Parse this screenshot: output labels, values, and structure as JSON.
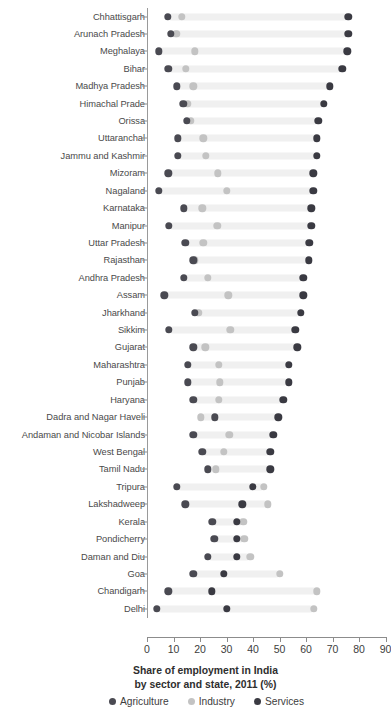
{
  "chart_data": {
    "type": "scatter",
    "title": "Share of employment in India by sector and state, 2011 (%)",
    "title_line1": "Share of employment in India",
    "title_line2": "by sector and state, 2011 (%)",
    "xlabel": "",
    "ylabel": "",
    "xlim": [
      0,
      90
    ],
    "xticks": [
      0,
      10,
      20,
      30,
      40,
      50,
      60,
      70,
      80,
      90
    ],
    "xtick_labels": [
      "0",
      "10",
      "20",
      "30",
      "40",
      "50",
      "60",
      "70",
      "80",
      "90"
    ],
    "grid": false,
    "legend_position": "bottom",
    "legend": [
      {
        "label": "Agriculture",
        "color": "#4a4a52",
        "key": "agriculture"
      },
      {
        "label": "Industry",
        "color": "#c3c3c3",
        "key": "industry"
      },
      {
        "label": "Services",
        "color": "#3a3a42",
        "key": "services"
      }
    ],
    "categories": [
      "Chhattisgarh",
      "Arunach Pradesh",
      "Meghalaya",
      "Bihar",
      "Madhya Pradesh",
      "Himachal Prade",
      "Orissa",
      "Uttaranchal",
      "Jammu and Kashmir",
      "Mizoram",
      "Nagaland",
      "Karnataka",
      "Manipur",
      "Uttar Pradesh",
      "Rajasthan",
      "Andhra Pradesh",
      "Assam",
      "Jharkhand",
      "Sikkim",
      "Gujarat",
      "Maharashtra",
      "Punjab",
      "Haryana",
      "Dadra and Nagar Haveli",
      "Andaman and Nicobar Islands",
      "West Bengal",
      "Tamil Nadu",
      "Tripura",
      "Lakshadweep",
      "Kerala",
      "Pondicherry",
      "Daman and Diu",
      "Goa",
      "Chandigarh",
      "Delhi"
    ],
    "series": [
      {
        "name": "Agriculture",
        "key": "agriculture",
        "color": "#4a4a52",
        "values": [
          7.9,
          9.0,
          4.5,
          8.0,
          11.3,
          13.7,
          15.0,
          11.7,
          11.7,
          8.0,
          4.5,
          14.0,
          8.3,
          14.4,
          17.5,
          14.0,
          6.5,
          18.0,
          8.3,
          17.5,
          15.4,
          15.4,
          17.5,
          25.7,
          17.5,
          20.8,
          23.0,
          11.3,
          14.4,
          24.6,
          25.4,
          23.0,
          17.5,
          8.0,
          3.6
        ]
      },
      {
        "name": "Industry",
        "key": "industry",
        "color": "#c3c3c3",
        "values": [
          13.2,
          11.0,
          18.0,
          14.6,
          17.5,
          15.4,
          16.6,
          21.2,
          22.3,
          26.8,
          30.0,
          20.8,
          26.5,
          21.2,
          18.0,
          23.0,
          30.7,
          19.3,
          31.4,
          22.0,
          27.0,
          27.5,
          27.0,
          20.4,
          31.0,
          29.0,
          26.0,
          44.0,
          45.7,
          36.3,
          36.7,
          39.0,
          50.0,
          64.0,
          63.0
        ]
      },
      {
        "name": "Services",
        "key": "services",
        "color": "#3a3a42",
        "values": [
          76.0,
          76.0,
          75.6,
          73.7,
          69.0,
          66.7,
          64.7,
          64.0,
          64.0,
          62.7,
          62.7,
          62.0,
          62.0,
          61.3,
          61.0,
          59.0,
          59.0,
          58.0,
          56.0,
          56.7,
          53.6,
          53.4,
          51.5,
          49.6,
          47.7,
          46.5,
          46.5,
          40.0,
          36.0,
          34.0,
          34.0,
          34.0,
          28.9,
          24.4,
          30.0
        ]
      }
    ]
  }
}
